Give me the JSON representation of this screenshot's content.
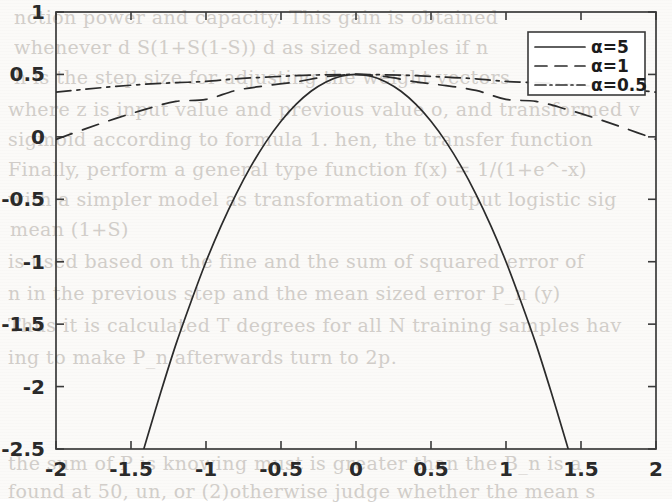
{
  "background": {
    "kind": "scanned-book-page",
    "ghost_lines": [
      {
        "text": "nction    power and capacity. This gain is obtained",
        "x": 14,
        "y": 6,
        "flip": false
      },
      {
        "text": "whenever  d   S(1+S(1-S))   d       as  sized  samples  if n",
        "x": 14,
        "y": 36,
        "flip": false
      },
      {
        "text": "h  is  the  step size  for adjusting  the  weight  vectors",
        "x": 14,
        "y": 66,
        "flip": false
      },
      {
        "text": "where z is input value and previous value o, and transformed v",
        "x": 8,
        "y": 98,
        "flip": false
      },
      {
        "text": "sigmoid according to formula  1.  hen,     the   transfer function",
        "x": 8,
        "y": 128,
        "flip": false
      },
      {
        "text": "Finally, perform a general type function    f(x) = 1/(1+e^-x)",
        "x": 8,
        "y": 158,
        "flip": false
      },
      {
        "text": "with a  simpler model  as  transformation  of output  logistic  sig",
        "x": 8,
        "y": 188,
        "flip": false
      },
      {
        "text": "mean    (1+S)",
        "x": 10,
        "y": 218,
        "flip": false
      },
      {
        "text": "is used based  on  the    fine    and the  sum of  squared  error of",
        "x": 8,
        "y": 250,
        "flip": false
      },
      {
        "text": "n   in  the  previous step  and  the  mean  sized  error  P_n    (y)",
        "x": 8,
        "y": 282,
        "flip": false
      },
      {
        "text": "Thus  it  is calculated  T  degrees  for  all  N  training  samples  hav",
        "x": 8,
        "y": 314,
        "flip": false
      },
      {
        "text": "ing  to  make  P_n  afterwards  turn to  2p.",
        "x": 8,
        "y": 346,
        "flip": false
      },
      {
        "text": "the  sum  of  P  is  knowing  must  is  greater  than  the  B_n  is  a",
        "x": 8,
        "y": 452,
        "flip": false
      },
      {
        "text": "found  at  50,  un,  or (2)otherwise judge whether  the  mean  s",
        "x": 8,
        "y": 480,
        "flip": false
      }
    ]
  },
  "chart_data": {
    "type": "line",
    "title": "",
    "xlabel": "",
    "ylabel": "",
    "xlim": [
      -2,
      2
    ],
    "ylim": [
      -2.5,
      1
    ],
    "xticks": [
      "-2",
      "-1.5",
      "-1",
      "-0.5",
      "0",
      "0.5",
      "1",
      "1.5",
      "2"
    ],
    "xtick_values": [
      -2,
      -1.5,
      -1,
      -0.5,
      0,
      0.5,
      1,
      1.5,
      2
    ],
    "yticks": [
      "1",
      "0.5",
      "0",
      "-0.5",
      "-1",
      "-1.5",
      "-2",
      "-2.5"
    ],
    "ytick_values": [
      1,
      0.5,
      0,
      -0.5,
      -1,
      -1.5,
      -2,
      -2.5
    ],
    "grid": false,
    "legend_position": "upper right",
    "formula": "y = 1/(1 + exp(alpha * x^2)) * 2 * 0.5  (bell curves peaking at 0.5, x=0)",
    "series": [
      {
        "name": "alpha=5",
        "legend_label": "α=5",
        "alpha": 5,
        "linestyle": "solid",
        "x": [
          -1.45,
          -1.4,
          -1.3,
          -1.2,
          -1.1,
          -1.0,
          -0.9,
          -0.8,
          -0.7,
          -0.6,
          -0.5,
          -0.4,
          -0.3,
          -0.2,
          -0.1,
          0,
          0.1,
          0.2,
          0.3,
          0.4,
          0.5,
          0.6,
          0.7,
          0.8,
          0.9,
          1.0,
          1.1,
          1.2,
          1.3,
          1.4,
          1.45
        ],
        "y": [
          -2.65,
          -2.44,
          -2.04,
          -1.66,
          -1.32,
          -1.0,
          -0.715,
          -0.46,
          -0.235,
          -0.04,
          0.125,
          0.26,
          0.365,
          0.44,
          0.485,
          0.5,
          0.485,
          0.44,
          0.365,
          0.26,
          0.125,
          -0.04,
          -0.235,
          -0.46,
          -0.715,
          -1.0,
          -1.32,
          -1.66,
          -2.04,
          -2.44,
          -2.65
        ]
      },
      {
        "name": "alpha=1",
        "legend_label": "α=1",
        "alpha": 1,
        "linestyle": "dashed",
        "x": [
          -2,
          -1.8,
          -1.6,
          -1.4,
          -1.2,
          -1.0,
          -0.8,
          -0.6,
          -0.4,
          -0.2,
          0,
          0.2,
          0.4,
          0.6,
          0.8,
          1.0,
          1.2,
          1.4,
          1.6,
          1.8,
          2
        ],
        "y": [
          -0.02,
          0.066,
          0.148,
          0.222,
          0.284,
          0.3,
          0.372,
          0.41,
          0.44,
          0.482,
          0.5,
          0.482,
          0.44,
          0.41,
          0.372,
          0.3,
          0.284,
          0.222,
          0.148,
          0.066,
          -0.02
        ]
      },
      {
        "name": "alpha=0.5",
        "legend_label": "α=0.5",
        "alpha": 0.5,
        "linestyle": "dashdot",
        "x": [
          -2,
          -1.8,
          -1.6,
          -1.4,
          -1.2,
          -1.0,
          -0.8,
          -0.6,
          -0.4,
          -0.2,
          0,
          0.2,
          0.4,
          0.6,
          0.8,
          1.0,
          1.2,
          1.4,
          1.6,
          1.8,
          2
        ],
        "y": [
          0.358,
          0.382,
          0.404,
          0.422,
          0.434,
          0.444,
          0.465,
          0.478,
          0.49,
          0.497,
          0.5,
          0.497,
          0.49,
          0.478,
          0.465,
          0.444,
          0.434,
          0.422,
          0.404,
          0.382,
          0.358
        ]
      }
    ]
  },
  "style": {
    "axis_color": "#3a3a3a",
    "curve_color": "#2b2b2b",
    "tick_text_color": "#2a2a2a",
    "page_color": "#fbfaf8"
  }
}
